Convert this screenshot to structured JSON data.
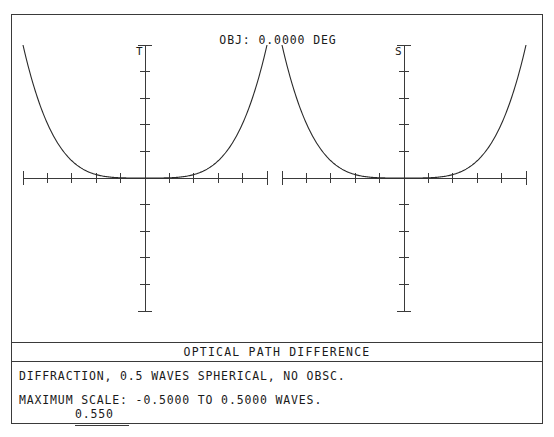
{
  "window": {
    "title": "OPTICAL PATH DIFFERENCE"
  },
  "plot": {
    "obj_label": "OBJ: 0.0000 DEG",
    "tangential_tag": "T",
    "sagittal_tag": "S"
  },
  "footer": {
    "line1": "DIFFRACTION, 0.5 WAVES SPHERICAL, NO OBSC.",
    "line2": "MAXIMUM SCALE: -0.5000 TO 0.5000 WAVES.",
    "wavelength": "0.550"
  },
  "colors": {
    "ink": "#1a1a1a",
    "rule": "#3a3a3a",
    "curve": "#2a2a2a",
    "background": "#ffffff"
  },
  "chart_data": {
    "type": "line",
    "title": "OPTICAL PATH DIFFERENCE",
    "subtitle": "OBJ: 0.0000 DEG",
    "xlabel": "",
    "ylabel": "",
    "ylim": [
      -0.5,
      0.5
    ],
    "xlim": [
      -1,
      1
    ],
    "y_units": "waves",
    "x_units": "normalized pupil coordinate",
    "grid": false,
    "legend": false,
    "y_major_ticks": [
      -0.5,
      -0.4,
      -0.3,
      -0.2,
      -0.1,
      0.0,
      0.1,
      0.2,
      0.3,
      0.4,
      0.5
    ],
    "x_major_ticks": [
      -1.0,
      -0.8,
      -0.6,
      -0.4,
      -0.2,
      0.0,
      0.2,
      0.4,
      0.6,
      0.8,
      1.0
    ],
    "panels": [
      {
        "name": "T",
        "label": "Tangential",
        "x": [
          -1.0,
          -0.9,
          -0.8,
          -0.7,
          -0.6,
          -0.5,
          -0.4,
          -0.3,
          -0.2,
          -0.1,
          0.0,
          0.1,
          0.2,
          0.3,
          0.4,
          0.5,
          0.6,
          0.7,
          0.8,
          0.9,
          1.0
        ],
        "values": [
          0.5,
          0.328,
          0.205,
          0.12,
          0.065,
          0.031,
          0.0128,
          0.00405,
          0.0008,
          5e-05,
          0.0,
          5e-05,
          0.0008,
          0.00405,
          0.0128,
          0.031,
          0.065,
          0.12,
          0.205,
          0.328,
          0.5
        ]
      },
      {
        "name": "S",
        "label": "Sagittal",
        "x": [
          -1.0,
          -0.9,
          -0.8,
          -0.7,
          -0.6,
          -0.5,
          -0.4,
          -0.3,
          -0.2,
          -0.1,
          0.0,
          0.1,
          0.2,
          0.3,
          0.4,
          0.5,
          0.6,
          0.7,
          0.8,
          0.9,
          1.0
        ],
        "values": [
          0.5,
          0.328,
          0.205,
          0.12,
          0.065,
          0.031,
          0.0128,
          0.00405,
          0.0008,
          5e-05,
          0.0,
          5e-05,
          0.0008,
          0.00405,
          0.0128,
          0.031,
          0.065,
          0.12,
          0.205,
          0.328,
          0.5
        ]
      }
    ],
    "function": "w = 0.5 * rho^4",
    "annotations": [
      "OBJ: 0.0000 DEG",
      "T",
      "S"
    ]
  }
}
